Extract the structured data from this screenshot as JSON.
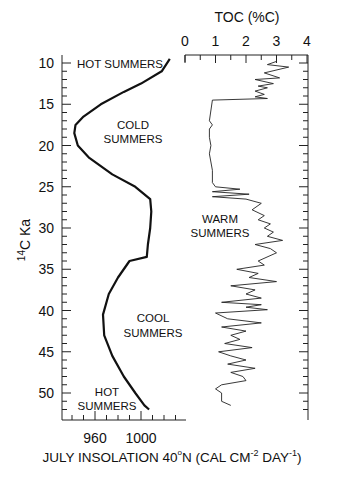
{
  "chart_data": [
    {
      "type": "line",
      "title": "",
      "xlabel": "JULY INSOLATION 40°N (CAL CM-2 DAY-1)",
      "ylabel": "14C Ka",
      "xlim": [
        931,
        1039
      ],
      "ylim": [
        52,
        9
      ],
      "y_inverted": true,
      "xticks": [
        960,
        1000
      ],
      "yticks": [
        10,
        15,
        20,
        25,
        30,
        35,
        40,
        45,
        50
      ],
      "grid": false,
      "series": [
        {
          "name": "July insolation 40N",
          "x": [
            1025,
            1018,
            1000,
            985,
            965,
            950,
            943,
            942,
            945,
            955,
            975,
            995,
            1008,
            1009,
            1008,
            1006,
            1005,
            990,
            980,
            972,
            967,
            968,
            975,
            985,
            995,
            1003,
            1007
          ],
          "y": [
            9.5,
            11,
            12.5,
            13.5,
            15,
            16.5,
            17.5,
            18.5,
            20,
            21.5,
            23.5,
            25,
            26.5,
            28,
            30,
            32,
            33.5,
            34,
            36,
            38,
            40.5,
            43,
            45.5,
            48,
            50,
            51.5,
            52
          ]
        }
      ],
      "annotations": [
        "HOT SUMMERS",
        "COLD SUMMERS",
        "COOL SUMMERS",
        "HOT SUMMERS"
      ]
    },
    {
      "type": "line",
      "title": "TOC (%C)",
      "xlabel": "TOC (%C)",
      "ylabel": "14C Ka",
      "xlim": [
        0,
        4
      ],
      "ylim": [
        52,
        9
      ],
      "xticks": [
        0,
        1,
        2,
        3,
        4
      ],
      "grid": false,
      "series": [
        {
          "name": "TOC",
          "x": [
            3.0,
            2.7,
            3.4,
            2.6,
            3.1,
            2.3,
            2.9,
            2.4,
            2.7,
            2.3,
            2.6,
            2.3,
            2.7,
            0.9,
            0.8,
            0.9,
            0.8,
            0.8,
            0.85,
            0.8,
            0.85,
            0.9,
            0.9,
            1.0,
            1.8,
            0.9,
            2.1,
            0.9,
            2.0,
            2.5,
            2.2,
            2.6,
            2.4,
            2.8,
            2.6,
            2.9,
            2.7,
            3.2,
            2.3,
            2.8,
            3.0,
            2.4,
            2.6,
            1.7,
            2.4,
            2.1,
            3.0,
            1.5,
            2.3,
            2.0,
            2.5,
            1.2,
            2.5,
            2.0,
            2.7,
            1.0,
            1.4,
            2.5,
            1.2,
            2.0,
            1.5,
            1.8,
            1.3,
            2.2,
            1.1,
            1.5,
            2.0,
            1.4,
            2.3,
            1.5,
            1.9,
            2.0,
            1.2,
            1.0,
            1.2,
            1.2,
            1.5
          ],
          "y": [
            9.8,
            10.2,
            10.5,
            11.2,
            11.8,
            12.0,
            12.5,
            12.8,
            13.0,
            13.4,
            13.8,
            14.1,
            14.3,
            14.5,
            17.0,
            17.5,
            18.0,
            19.0,
            20.0,
            21.0,
            22.0,
            23.0,
            24.5,
            25.0,
            25.3,
            25.6,
            25.9,
            26.2,
            26.5,
            27.0,
            27.8,
            28.5,
            29.0,
            29.5,
            30.0,
            30.5,
            31.0,
            31.5,
            32.0,
            32.5,
            33.0,
            34.0,
            34.5,
            35.0,
            35.5,
            36.0,
            36.5,
            37.0,
            37.5,
            38.0,
            38.5,
            39.0,
            39.3,
            39.6,
            39.9,
            40.3,
            41.0,
            41.5,
            42.0,
            42.5,
            43.0,
            43.5,
            44.0,
            44.5,
            45.0,
            45.5,
            46.0,
            46.5,
            47.0,
            47.5,
            48.0,
            48.5,
            49.0,
            49.5,
            50.0,
            51.0,
            51.5
          ]
        }
      ],
      "annotations": [
        "WARM SUMMERS"
      ]
    }
  ],
  "labels": {
    "toc_title": "TOC (%C)",
    "toc_ticks": [
      "0",
      "1",
      "2",
      "3",
      "4"
    ],
    "y_axis_label": "14C Ka",
    "y_ticks": [
      "10",
      "15",
      "20",
      "25",
      "30",
      "35",
      "40",
      "45",
      "50"
    ],
    "x_ticks": [
      "960",
      "1000"
    ],
    "x_axis_label_main": "JULY INSOLATION 40",
    "x_axis_label_deg": "o",
    "x_axis_label_n": "N (CAL CM",
    "x_axis_label_exp1": "-2",
    "x_axis_label_day": " DAY",
    "x_axis_label_exp2": "-1",
    "x_axis_label_close": ")",
    "hot_summers_top": "HOT SUMMERS",
    "cold_line1": "COLD",
    "cold_line2": "SUMMERS",
    "warm_line1": "WARM",
    "warm_line2": "SUMMERS",
    "cool_line1": "COOL",
    "cool_line2": "SUMMERS",
    "hot_bottom_line1": "HOT",
    "hot_bottom_line2": "SUMMERS"
  }
}
